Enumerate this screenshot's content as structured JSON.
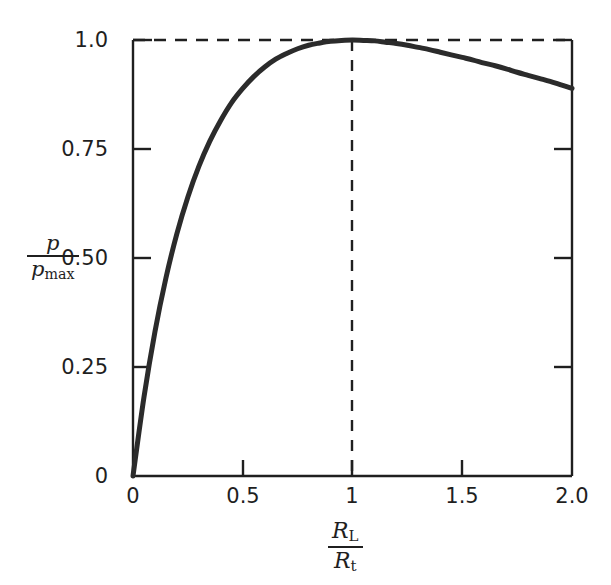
{
  "chart_data": {
    "type": "line",
    "title": "",
    "subtitle": "",
    "xlabel": "R_L / R_t",
    "ylabel": "p / p_max",
    "xlabel_parts": {
      "numerator_symbol": "R",
      "numerator_subscript": "L",
      "denominator_symbol": "R",
      "denominator_subscript": "t"
    },
    "ylabel_parts": {
      "numerator_symbol": "p",
      "numerator_subscript": "",
      "denominator_symbol": "p",
      "denominator_subscript": "max"
    },
    "xlim": [
      0,
      2.0
    ],
    "ylim": [
      0,
      1.0
    ],
    "xticks": [
      0,
      0.5,
      1,
      1.5,
      2.0
    ],
    "xtick_labels": [
      "0",
      "0.5",
      "1",
      "1.5",
      "2.0"
    ],
    "yticks": [
      0,
      0.25,
      0.5,
      0.75,
      1.0
    ],
    "ytick_labels": [
      "0",
      "0.25",
      "0.50",
      "0.75",
      "1.0"
    ],
    "grid": false,
    "legend": "none",
    "tick_direction": "in",
    "line_color": "#2b2b2b",
    "line_width": 4,
    "axis_color": "#1f1f1f",
    "background_color": "#ffffff",
    "annotations": [
      {
        "name": "max-power-horizontal-guide",
        "type": "dashed-line",
        "orientation": "horizontal",
        "value": 1.0,
        "from": 0,
        "to": 2.0
      },
      {
        "name": "matched-load-vertical-guide",
        "type": "dashed-line",
        "orientation": "vertical",
        "value": 1.0,
        "from": 0,
        "to": 1.0
      }
    ],
    "series": [
      {
        "name": "p/p_max",
        "formula": "4r/(1+r)^2",
        "x": [
          0,
          0.05,
          0.1,
          0.15,
          0.2,
          0.25,
          0.3,
          0.35,
          0.4,
          0.45,
          0.5,
          0.55,
          0.6,
          0.65,
          0.7,
          0.75,
          0.8,
          0.85,
          0.9,
          0.95,
          1.0,
          1.05,
          1.1,
          1.15,
          1.2,
          1.25,
          1.3,
          1.35,
          1.4,
          1.45,
          1.5,
          1.55,
          1.6,
          1.65,
          1.7,
          1.75,
          1.8,
          1.85,
          1.9,
          1.95,
          2.0
        ],
        "values": [
          0,
          0.181,
          0.331,
          0.454,
          0.556,
          0.64,
          0.71,
          0.768,
          0.816,
          0.857,
          0.889,
          0.916,
          0.938,
          0.956,
          0.969,
          0.98,
          0.988,
          0.993,
          0.997,
          0.999,
          1.0,
          0.999,
          0.998,
          0.995,
          0.992,
          0.988,
          0.983,
          0.978,
          0.972,
          0.966,
          0.96,
          0.954,
          0.947,
          0.941,
          0.934,
          0.926,
          0.919,
          0.912,
          0.905,
          0.897,
          0.889
        ]
      }
    ],
    "key_points": [
      {
        "label": "origin",
        "x": 0,
        "y": 0
      },
      {
        "label": "maximum-power-transfer",
        "x": 1.0,
        "y": 1.0
      },
      {
        "label": "right-endpoint",
        "x": 2.0,
        "y": 0.889
      }
    ]
  }
}
